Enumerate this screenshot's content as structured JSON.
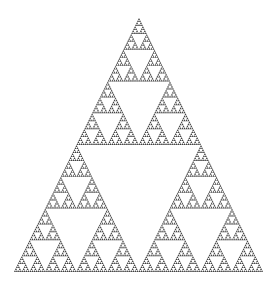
{
  "figure": {
    "type": "sierpinski-triangle",
    "depth": 7,
    "fill_color": "#3f3f3f",
    "background": "#ffffff",
    "apex": [
      139,
      18
    ],
    "bottom_left": [
      14,
      272
    ],
    "bottom_right": [
      263,
      272
    ]
  }
}
